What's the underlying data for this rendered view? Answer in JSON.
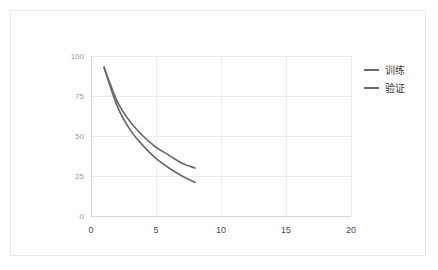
{
  "chart_data": {
    "type": "line",
    "title": "",
    "subtitle": "",
    "xlabel": "",
    "ylabel": "",
    "xlim": [
      0,
      20
    ],
    "ylim": [
      0,
      100
    ],
    "grid": true,
    "legend_position": "right",
    "xticks": [
      "0",
      "5",
      "10",
      "15",
      "20"
    ],
    "xtick_values": [
      0,
      5,
      10,
      15,
      20
    ],
    "yticks": [
      "0",
      "25",
      "50",
      "75",
      "100"
    ],
    "ytick_values": [
      0,
      25,
      50,
      75,
      100
    ],
    "x": [
      1,
      2,
      3,
      4,
      5,
      6,
      7,
      8
    ],
    "series": [
      {
        "name": "训练",
        "color": "#6b6b6b",
        "values": [
          93,
          72,
          59,
          50,
          43,
          38,
          33,
          30
        ]
      },
      {
        "name": "验证",
        "color": "#6b6b6b",
        "values": [
          93,
          69,
          54,
          44,
          36,
          30,
          25,
          21
        ]
      }
    ]
  },
  "legend": {
    "entries": [
      {
        "label": "训练",
        "color": "#6b6b6b"
      },
      {
        "label": "验证",
        "color": "#6b6b6b"
      }
    ]
  },
  "axes": {
    "x_tick_0": "0",
    "x_tick_1": "5",
    "x_tick_2": "10",
    "x_tick_3": "15",
    "x_tick_4": "20",
    "y_tick_0": "0",
    "y_tick_1": "25",
    "y_tick_2": "50",
    "y_tick_3": "75",
    "y_tick_4": "100"
  },
  "colors": {
    "grid": "#ececec",
    "spine": "#d8d8d8",
    "line": "#6b6b6b",
    "card_border": "#e9e9e9",
    "tick_text_y": "#9a9a9a",
    "tick_text_x": "#4a4a4a",
    "legend_text": "#3d3d3d",
    "background": "#ffffff"
  }
}
